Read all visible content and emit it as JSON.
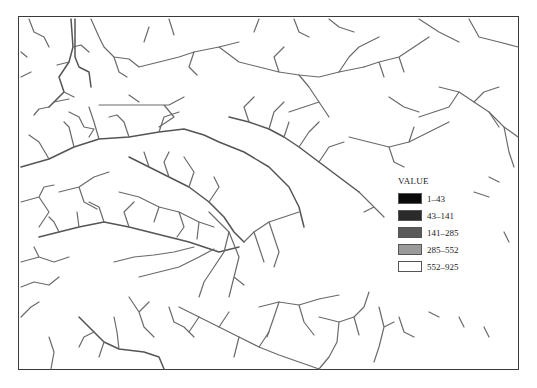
{
  "map": {
    "type": "stream network raster (flow accumulation)",
    "frame_color": "#3a3a3a",
    "stream_color": "#6a6a6a"
  },
  "legend": {
    "title": "VALUE",
    "items": [
      {
        "label": "1–43",
        "color": "#0a0a0a"
      },
      {
        "label": "43–141",
        "color": "#2a2a2a"
      },
      {
        "label": "141–285",
        "color": "#5a5a5a"
      },
      {
        "label": "285–552",
        "color": "#9a9a9a"
      },
      {
        "label": "552–925",
        "color": "#ffffff"
      }
    ]
  },
  "caption": ""
}
